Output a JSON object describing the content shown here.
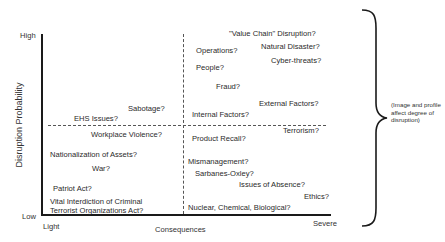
{
  "axes": {
    "y_title": "Disruption Probability",
    "y_high": "High",
    "y_low": "Low",
    "x_title": "Consequences",
    "x_light": "Light",
    "x_severe": "Severe"
  },
  "quadrants": {
    "top_left": [
      {
        "label": "Sabotage?"
      },
      {
        "label": "EHS Issues?"
      }
    ],
    "top_right": [
      {
        "label": "\"Value Chain\" Disruption?"
      },
      {
        "label": "Operations?"
      },
      {
        "label": "Natural Disaster?"
      },
      {
        "label": "Cyber-threats?"
      },
      {
        "label": "People?"
      },
      {
        "label": "Fraud?"
      },
      {
        "label": "External Factors?"
      },
      {
        "label": "Internal Factors?"
      }
    ],
    "bottom_left": [
      {
        "label": "Workplace Violence?"
      },
      {
        "label": "Nationalization of Assets?"
      },
      {
        "label": "War?"
      },
      {
        "label": "Patriot Act?"
      },
      {
        "label": "Vital Interdiction of Criminal"
      },
      {
        "label": "Terrorist Organizations Act?"
      }
    ],
    "bottom_right": [
      {
        "label": "Terrorism?"
      },
      {
        "label": "Product Recall?"
      },
      {
        "label": "Mismanagement?"
      },
      {
        "label": "Sarbanes-Oxley?"
      },
      {
        "label": "Issues of Absence?"
      },
      {
        "label": "Ethics?"
      },
      {
        "label": "Nuclear, Chemical, Biological?"
      }
    ]
  },
  "brace_note": "(Image and profile affect degree of disruption)",
  "colors": {
    "axis": "#1a1a1a",
    "text": "#2a2a2a",
    "dashed": "#555555"
  }
}
